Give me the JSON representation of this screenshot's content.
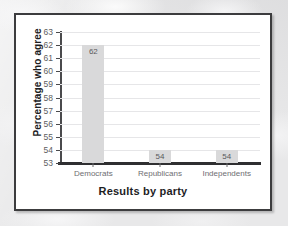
{
  "figure": {
    "background_color": "#e8e8e9",
    "card_color": "#ffffff",
    "border_color": "#3c3c3e"
  },
  "chart_data": {
    "type": "bar",
    "title": "",
    "xlabel": "Results by party",
    "ylabel": "Percentage who agree",
    "categories": [
      "Democrats",
      "Republicans",
      "Independents"
    ],
    "values": [
      62,
      54,
      54
    ],
    "value_labels": [
      "62",
      "54",
      "54"
    ],
    "ylim": [
      53,
      63
    ],
    "ytick_step": 1,
    "yticks": [
      63,
      62,
      61,
      60,
      59,
      58,
      57,
      56,
      55,
      54,
      53
    ],
    "ytick_labels": [
      "63",
      "62",
      "61",
      "60",
      "59",
      "58",
      "57",
      "56",
      "55",
      "54",
      "53"
    ],
    "grid": true,
    "grid_axis": "y",
    "grid_color": "#e6e6e8",
    "legend": false,
    "legend_position": "none",
    "bar_color": "#d9d9da",
    "axis_color": "#2f2f31"
  }
}
